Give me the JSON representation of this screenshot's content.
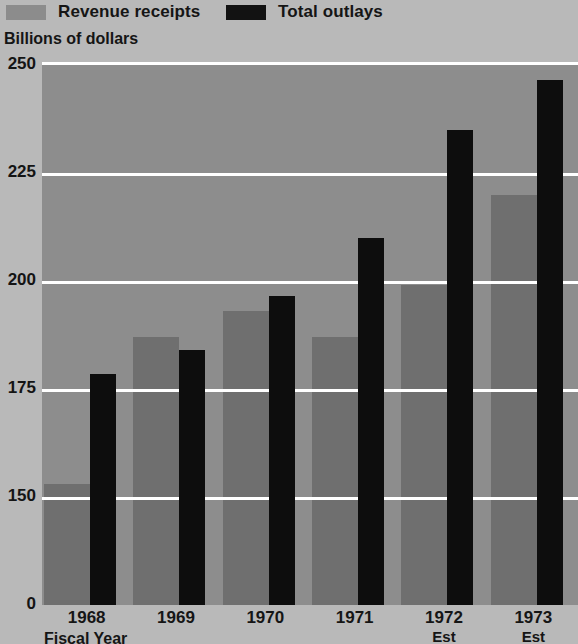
{
  "legend": {
    "items": [
      {
        "label": "Revenue receipts",
        "swatch": "gray-swatch",
        "color": "#8c8c8c"
      },
      {
        "label": "Total outlays",
        "swatch": "black-swatch",
        "color": "#121212"
      }
    ]
  },
  "axis_title": "Billions of dollars",
  "fiscal_year_label": "Fiscal Year",
  "chart_data": {
    "type": "bar",
    "title": "",
    "subtitle": "",
    "xlabel": "Fiscal Year",
    "ylabel": "Billions of dollars",
    "ylim": [
      0,
      250
    ],
    "yticks": [
      0,
      150,
      175,
      200,
      225,
      250
    ],
    "ytick_labels": [
      "0",
      "150",
      "175",
      "200",
      "225",
      "250"
    ],
    "gridlines": [
      150,
      175,
      200,
      225,
      250
    ],
    "grid": true,
    "legend_position": "top",
    "categories": [
      "1968",
      "1969",
      "1970",
      "1971",
      "1972",
      "1973"
    ],
    "category_sublabels": [
      "",
      "",
      "",
      "",
      "Est",
      "Est"
    ],
    "series": [
      {
        "name": "Revenue receipts",
        "color": "#6f6f6f",
        "values": [
          153,
          187,
          193,
          187,
          199,
          220
        ]
      },
      {
        "name": "Total outlays",
        "color": "#0d0d0d",
        "values": [
          178.5,
          184,
          196.5,
          210,
          235,
          246.5
        ]
      }
    ]
  }
}
